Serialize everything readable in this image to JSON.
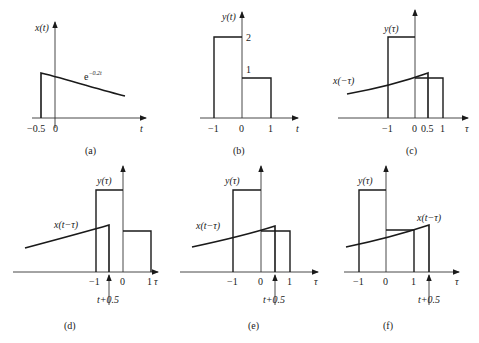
{
  "figure": {
    "panels": [
      {
        "id": "a",
        "caption": "(a)",
        "ylabel": "x(t)",
        "xlabel": "t",
        "curve_label": "e",
        "curve_label_exp": "−0.2t",
        "ticks": [
          "−0.5",
          "0"
        ]
      },
      {
        "id": "b",
        "caption": "(b)",
        "ylabel": "y(t)",
        "xlabel": "t",
        "ticks": [
          "−1",
          "0",
          "1"
        ],
        "levels": [
          "2",
          "1"
        ]
      },
      {
        "id": "c",
        "caption": "(c)",
        "ylabel": "y(τ)",
        "curve_label": "x(−τ)",
        "xlabel": "τ",
        "ticks": [
          "−1",
          "0",
          "0.5",
          "1"
        ]
      },
      {
        "id": "d",
        "caption": "(d)",
        "ylabel": "y(τ)",
        "curve_label": "x(t−τ)",
        "xlabel": "τ",
        "ticks": [
          "−1",
          "0",
          "1"
        ],
        "marker": "t+0.5"
      },
      {
        "id": "e",
        "caption": "(e)",
        "ylabel": "y(τ)",
        "curve_label": "x(t−τ)",
        "xlabel": "τ",
        "ticks": [
          "−1",
          "0",
          "1"
        ],
        "marker": "t+0.5"
      },
      {
        "id": "f",
        "caption": "(f)",
        "ylabel": "y(τ)",
        "curve_label": "x(t−τ)",
        "xlabel": "τ",
        "ticks": [
          "−1",
          "0",
          "1"
        ],
        "marker": "t+0.5"
      }
    ]
  }
}
